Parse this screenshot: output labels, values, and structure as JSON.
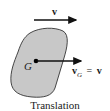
{
  "diagram": {
    "top_velocity_label": "v",
    "center_label": "G",
    "cg_velocity": {
      "symbol": "v",
      "subscript": "G",
      "equals": "=",
      "rhs": "v"
    },
    "caption": "Translation"
  },
  "colors": {
    "body_fill": "#c8c8c8",
    "body_stroke": "#333333",
    "arrow": "#111111"
  }
}
